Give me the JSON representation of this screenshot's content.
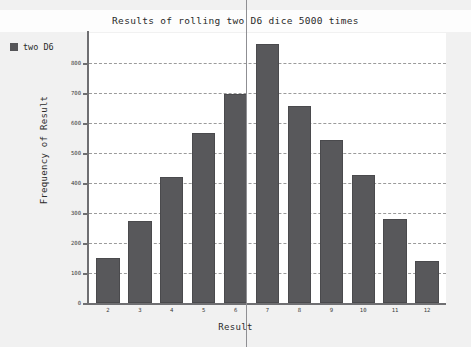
{
  "window": {
    "background_color": "#f1f1f1",
    "top_clipped_text": "........................"
  },
  "legend": {
    "position": "top-left-outside",
    "entries": [
      {
        "label": "two D6",
        "color": "#555558",
        "icon": "legend-swatch"
      }
    ]
  },
  "cursor": {
    "type": "vertical-line",
    "x_px": 246,
    "color": "#8f8f93"
  },
  "chart_data": {
    "type": "bar",
    "title": "Results of rolling two D6 dice 5000 times",
    "xlabel": "Result",
    "ylabel": "Frequency of Result",
    "categories": [
      "2",
      "3",
      "4",
      "5",
      "6",
      "7",
      "8",
      "9",
      "10",
      "11",
      "12"
    ],
    "values": [
      150,
      272,
      421,
      568,
      698,
      862,
      658,
      545,
      428,
      280,
      140
    ],
    "series": [
      {
        "name": "two D6",
        "color": "#58585b",
        "values": [
          150,
          272,
          421,
          568,
          698,
          862,
          658,
          545,
          428,
          280,
          140
        ]
      }
    ],
    "ylim": [
      0,
      900
    ],
    "yticks": [
      0,
      100,
      200,
      300,
      400,
      500,
      600,
      700,
      800
    ],
    "ytick_labels": [
      "0",
      "100",
      "200",
      "300",
      "400",
      "500",
      "600",
      "700",
      "800"
    ],
    "xtick_labels": [
      "2",
      "3",
      "4",
      "5",
      "6",
      "7",
      "8",
      "9",
      "10",
      "11",
      "12"
    ],
    "grid": true,
    "grid_style": "dashed",
    "grid_color": "#8a8a8a",
    "legend_position": "outside-top-left",
    "plot_background": "#ffffff"
  }
}
